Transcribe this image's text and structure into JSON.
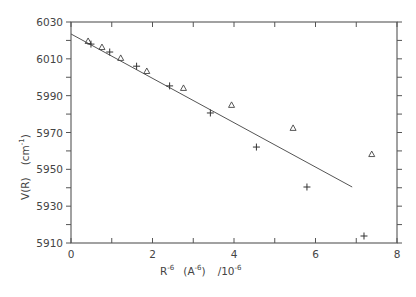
{
  "chart_data": {
    "type": "scatter",
    "title": "",
    "xlabel": "R^-6 (A^-6) /10^-6",
    "xlabel_parts": {
      "base": "R",
      "exp1": "-6",
      "unit_open": "(A",
      "exp2": "-6",
      "unit_close": ")",
      "scale": "/10",
      "exp3": "-6"
    },
    "ylabel": "V(R)  (cm^-1)",
    "ylabel_parts": {
      "base": "V(R)",
      "unit_open": "(cm",
      "exp": "-1",
      "unit_close": ")"
    },
    "xlim": [
      0,
      8
    ],
    "ylim": [
      5910,
      6030
    ],
    "x_ticks": [
      0,
      2,
      4,
      6,
      8
    ],
    "x_tick_labels": [
      "0",
      "2",
      "4",
      "6",
      "8"
    ],
    "y_ticks": [
      5910,
      5930,
      5950,
      5970,
      5990,
      6010,
      6030
    ],
    "y_tick_labels": [
      "5910",
      "5930",
      "5950",
      "5970",
      "5990",
      "6010",
      "6030"
    ],
    "grid": false,
    "legend": null,
    "series": [
      {
        "name": "triangles",
        "marker": "triangle",
        "x": [
          0.42,
          0.76,
          1.22,
          1.86,
          2.76,
          3.94,
          5.45,
          7.38
        ],
        "y": [
          6019.7,
          6016.4,
          6010.5,
          6003.4,
          5994.2,
          5985.0,
          5972.5,
          5958.3
        ]
      },
      {
        "name": "crosses",
        "marker": "plus",
        "x": [
          0.49,
          0.95,
          1.61,
          2.42,
          3.42,
          4.55,
          5.79,
          7.19
        ],
        "y": [
          6018.0,
          6013.7,
          6006.0,
          5995.3,
          5980.6,
          5962.1,
          5940.4,
          5913.8
        ]
      },
      {
        "name": "linear fit",
        "marker": "line",
        "x": [
          0.0,
          6.9
        ],
        "y": [
          6023.5,
          5940.4
        ]
      }
    ]
  }
}
